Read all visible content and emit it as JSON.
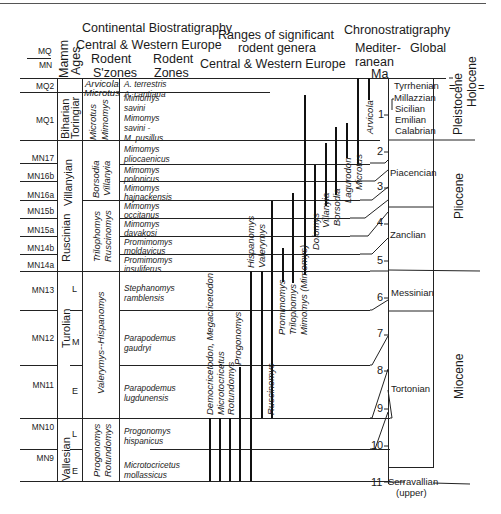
{
  "header": {
    "continental_title": "Continental Biostratigraphy",
    "continental_subtitle": "Central & Western Europe",
    "ranges_title_1": "Ranges of significant",
    "ranges_title_2": "rodent genera",
    "ranges_subtitle": "Central & Western Europe",
    "chrono_title": "Chronostratigraphy",
    "mediterranean_label_1": "Mediter-",
    "mediterranean_label_2": "ranean",
    "global_label": "Global",
    "ma_label": "Ma",
    "mq_label": "MQ",
    "mn_label": "MN",
    "mamm_ages_label_1": "Mamm",
    "mamm_ages_label_2": "Ages",
    "rodent_szones_1": "Rodent",
    "rodent_szones_2": "S'zones",
    "rodent_zones_1": "Rodent",
    "rodent_zones_2": "Zones"
  },
  "units": [
    {
      "code": "MQ2"
    },
    {
      "code": "MQ1"
    },
    {
      "code": "MN17"
    },
    {
      "code": "MN16b"
    },
    {
      "code": "MN16a"
    },
    {
      "code": "MN15b"
    },
    {
      "code": "MN15a"
    },
    {
      "code": "MN14b"
    },
    {
      "code": "MN14a"
    },
    {
      "code": "MN13"
    },
    {
      "code": "MN12"
    },
    {
      "code": "MN11"
    },
    {
      "code": "MN10"
    },
    {
      "code": "MN9"
    }
  ],
  "mammal_ages": {
    "biharian": "Biharian",
    "toringiar": "Toringiar",
    "villanyian": "Villanyian",
    "ruscinian": "Ruscinian",
    "turolian": "Turolian",
    "vallesian": "Vallesian",
    "sub_L1": "L",
    "sub_M": "M",
    "sub_E1": "E",
    "sub_L2": "L",
    "sub_E2": "E"
  },
  "superzones": {
    "arvicola": "Arvicola",
    "microtus_top": "Microtus",
    "microtus": "Microtus",
    "mimomys": "Mimomys",
    "borsodia": "Borsodia",
    "villanyia": "Villanyia",
    "triliophomys": "Trilophomys",
    "ruscinomys": "Ruscinomys",
    "valerymys_hispanomys": "Valerymys--Hispanomys",
    "progonomys": "Progonomys",
    "rotundomys": "Rotundomys"
  },
  "zones": [
    {
      "line1": "A. terrestris",
      "line2": ""
    },
    {
      "line1": "A. cantiana",
      "line2": ""
    },
    {
      "line1": "Mimomys",
      "line2": "savini"
    },
    {
      "line1": "Mimomys",
      "line2": "savini -"
    },
    {
      "line1": "M. pusillus",
      "line2": ""
    },
    {
      "line1": "Mimomys",
      "line2": "pliocaenicus"
    },
    {
      "line1": "Mimomys",
      "line2": "polonicus"
    },
    {
      "line1": "Mimomys",
      "line2": "hajnackensis"
    },
    {
      "line1": "Mimomys",
      "line2": "occitanus"
    },
    {
      "line1": "Mimomys",
      "line2": "davakosi"
    },
    {
      "line1": "Promimomys",
      "line2": "moldavicus"
    },
    {
      "line1": "Promimomys",
      "line2": "insuliferus"
    },
    {
      "line1": "Stephanomys",
      "line2": "ramblensis"
    },
    {
      "line1": "Parapodemus",
      "line2": "gaudryi"
    },
    {
      "line1": "Parapodemus",
      "line2": "lugdunensis"
    },
    {
      "line1": "Progonomys",
      "line2": "hispanicus"
    },
    {
      "line1": "Microtocricetus",
      "line2": "mollassicus"
    }
  ],
  "genera": [
    {
      "name": "Democricetodon, Megacricetodon"
    },
    {
      "name": "Microtocricetus"
    },
    {
      "name": "Rotundomys"
    },
    {
      "name": "Progonomys"
    },
    {
      "name": "Hispanomys"
    },
    {
      "name": "Valerymys"
    },
    {
      "name": "Ruscinomys"
    },
    {
      "name": "Promimomys"
    },
    {
      "name": "Trilophomys"
    },
    {
      "name": "Mimomys (Mimomys)"
    },
    {
      "name": "Dolomys"
    },
    {
      "name": "Villanyia"
    },
    {
      "name": "Borsodia"
    },
    {
      "name": "Lagurodon"
    },
    {
      "name": "Microtus"
    },
    {
      "name": "Arvicola"
    }
  ],
  "ma_ticks": [
    "1",
    "2",
    "3",
    "4",
    "5",
    "6",
    "7",
    "8",
    "9",
    "10",
    "11"
  ],
  "stages": {
    "tyrrhenian": "Tyrrhenian",
    "millazzian": "Millazzian",
    "sicilian": "Sicilian",
    "emilian": "Emilian",
    "calabrian": "Calabrian",
    "piacencian": "Piacencian",
    "zanclian": "Zanclian",
    "messinian": "Messinian",
    "tortonian": "Tortonian",
    "serravallian": "Serravallian",
    "serravallian_note": "(upper)"
  },
  "epochs": {
    "holocene": "Holocene",
    "pleistocene": "Pleistocene",
    "pliocene": "Pliocene",
    "miocene": "Miocene",
    "holocene_mark": "="
  }
}
